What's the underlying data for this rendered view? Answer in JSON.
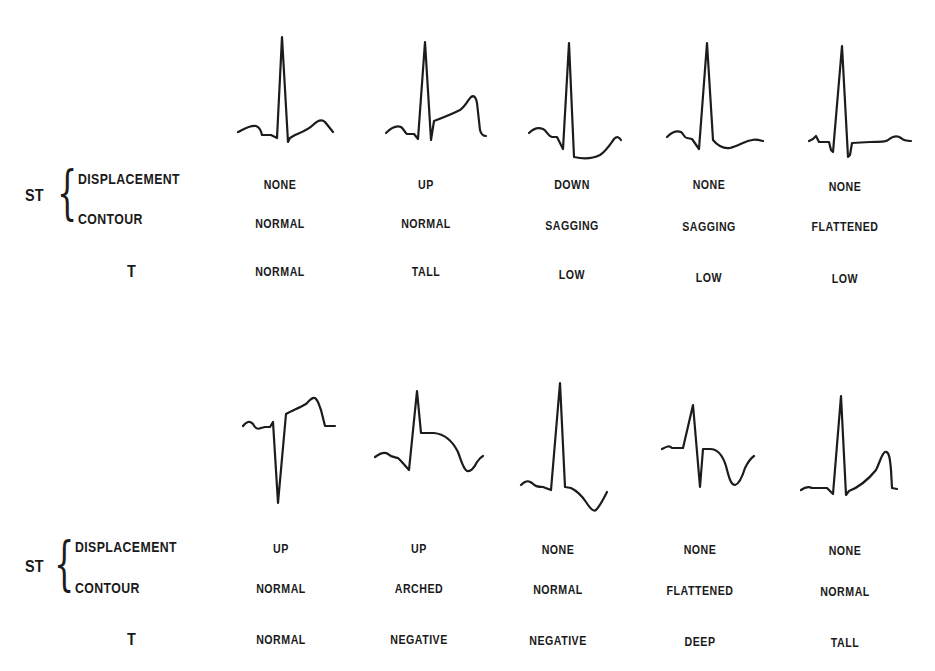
{
  "rows": [
    {
      "row_labels": {
        "st": "ST",
        "displacement": "DISPLACEMENT",
        "contour": "CONTOUR",
        "t": "T"
      },
      "panels": [
        {
          "st_displacement": "NONE",
          "st_contour": "NORMAL",
          "t": "NORMAL"
        },
        {
          "st_displacement": "UP",
          "st_contour": "NORMAL",
          "t": "TALL"
        },
        {
          "st_displacement": "DOWN",
          "st_contour": "SAGGING",
          "t": "LOW"
        },
        {
          "st_displacement": "NONE",
          "st_contour": "SAGGING",
          "t": "LOW"
        },
        {
          "st_displacement": "NONE",
          "st_contour": "FLATTENED",
          "t": "LOW"
        }
      ]
    },
    {
      "row_labels": {
        "st": "ST",
        "displacement": "DISPLACEMENT",
        "contour": "CONTOUR",
        "t": "T"
      },
      "panels": [
        {
          "st_displacement": "UP",
          "st_contour": "NORMAL",
          "t": "NORMAL"
        },
        {
          "st_displacement": "UP",
          "st_contour": "ARCHED",
          "t": "NEGATIVE"
        },
        {
          "st_displacement": "NONE",
          "st_contour": "NORMAL",
          "t": "NEGATIVE"
        },
        {
          "st_displacement": "NONE",
          "st_contour": "FLATTENED",
          "t": "DEEP"
        },
        {
          "st_displacement": "NONE",
          "st_contour": "NORMAL",
          "t": "TALL"
        }
      ]
    }
  ],
  "colors": {
    "ink": "#1c1c1c",
    "background": "#ffffff"
  }
}
